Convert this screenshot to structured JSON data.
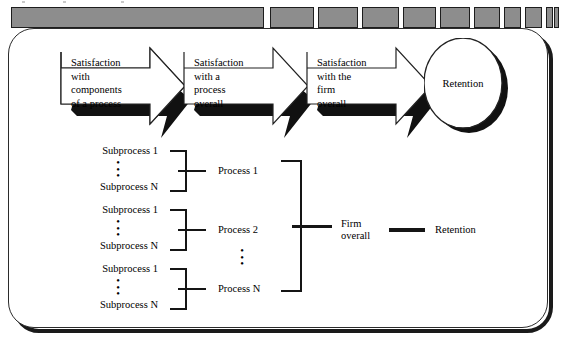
{
  "figure": {
    "background_color": "#ffffff",
    "ink_color": "#151515"
  },
  "top_strip": {
    "name": "segmented-progress-strip",
    "segment_fill": "#8d8d8d",
    "segment_border": "#1d1d1d",
    "segments": [
      {
        "x": 11,
        "width": 253
      },
      {
        "x": 270,
        "width": 44
      },
      {
        "x": 318,
        "width": 40
      },
      {
        "x": 362,
        "width": 37
      },
      {
        "x": 403,
        "width": 33
      },
      {
        "x": 440,
        "width": 30
      },
      {
        "x": 474,
        "width": 26
      },
      {
        "x": 504,
        "width": 17
      },
      {
        "x": 525,
        "width": 17
      },
      {
        "x": 546,
        "width": 7
      },
      {
        "x": 553,
        "width": 5
      },
      {
        "x": 559,
        "width": 4
      }
    ]
  },
  "flow": {
    "arrows": [
      {
        "id": "arrow-1",
        "label": "Satisfaction with components of a process",
        "lines": [
          "Satisfaction",
          "with",
          "components",
          "of a process"
        ],
        "x": 57,
        "y": 38
      },
      {
        "id": "arrow-2",
        "label": "Satisfaction with a process overall",
        "lines": [
          "Satisfaction",
          "with a",
          "process",
          "overall"
        ],
        "x": 180,
        "y": 38
      },
      {
        "id": "arrow-3",
        "label": "Satisfaction with the firm overall",
        "lines": [
          "Satisfaction",
          "with the",
          "firm",
          "overall"
        ],
        "x": 303,
        "y": 38
      }
    ],
    "outcome": {
      "id": "retention-ellipse",
      "label": "Retention"
    }
  },
  "hierarchy": {
    "groups": [
      {
        "id": "group-1",
        "first_label": "Subprocess 1",
        "last_label": "Subprocess N",
        "process_label": "Process 1",
        "top": 144
      },
      {
        "id": "group-2",
        "first_label": "Subprocess 1",
        "last_label": "Subprocess N",
        "process_label": "Process 2",
        "top": 203
      },
      {
        "id": "group-3",
        "first_label": "Subprocess 1",
        "last_label": "Subprocess N",
        "process_label": "Process N",
        "top": 262
      }
    ],
    "ellipsis_glyph": "•",
    "process_ellipsis_glyph": "•",
    "firm_overall": {
      "lines": [
        "Firm",
        "overall"
      ],
      "label": "Firm overall"
    },
    "retention": {
      "label": "Retention"
    }
  }
}
